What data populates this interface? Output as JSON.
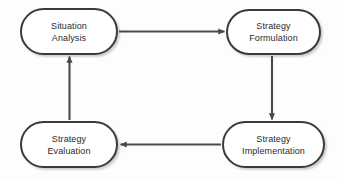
{
  "diagram": {
    "type": "cycle-flowchart",
    "background_color": "#fdfdfd",
    "node_border_color": "#3a3a3a",
    "node_fill_color": "#ffffff",
    "text_color": "#2b2b2b",
    "arrow_color": "#4a4a4a",
    "nodes": [
      {
        "id": "situation-analysis",
        "line1": "Situation",
        "line2": "Analysis",
        "position": "top-left"
      },
      {
        "id": "strategy-formulation",
        "line1": "Strategy",
        "line2": "Formulation",
        "position": "top-right"
      },
      {
        "id": "strategy-implementation",
        "line1": "Strategy",
        "line2": "Implementation",
        "position": "bottom-right"
      },
      {
        "id": "strategy-evaluation",
        "line1": "Strategy",
        "line2": "Evaluation",
        "position": "bottom-left"
      }
    ],
    "connectors": [
      {
        "id": "arrow-analysis-to-formulation",
        "from": "situation-analysis",
        "to": "strategy-formulation",
        "direction": "right"
      },
      {
        "id": "arrow-formulation-to-implementation",
        "from": "strategy-formulation",
        "to": "strategy-implementation",
        "direction": "down"
      },
      {
        "id": "arrow-implementation-to-evaluation",
        "from": "strategy-implementation",
        "to": "strategy-evaluation",
        "direction": "left"
      },
      {
        "id": "arrow-evaluation-to-analysis",
        "from": "strategy-evaluation",
        "to": "situation-analysis",
        "direction": "up"
      }
    ]
  }
}
